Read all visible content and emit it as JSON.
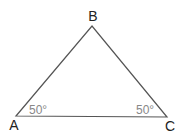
{
  "diagram": {
    "type": "triangle",
    "vertices": {
      "A": {
        "label": "A",
        "x": 16,
        "y": 116
      },
      "B": {
        "label": "B",
        "x": 92,
        "y": 26
      },
      "C": {
        "label": "C",
        "x": 167,
        "y": 117
      }
    },
    "angles": {
      "A": {
        "label": "50°"
      },
      "C": {
        "label": "50°"
      }
    },
    "colors": {
      "line": "#555555",
      "vertex_label": "#222222",
      "angle_label": "#888888"
    }
  }
}
